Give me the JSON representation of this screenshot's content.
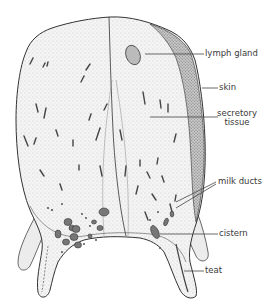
{
  "figure": {
    "labels": [
      {
        "id": "lymph-gland",
        "text": "lymph gland"
      },
      {
        "id": "skin",
        "text": "skin"
      },
      {
        "id": "secretory-tissue",
        "line1": "secretory",
        "line2": "tissue"
      },
      {
        "id": "milk-ducts",
        "text": "milk ducts"
      },
      {
        "id": "cistern",
        "text": "cistern"
      },
      {
        "id": "teat",
        "text": "teat"
      }
    ]
  },
  "colors": {
    "ink": "#3a3a3a",
    "fill": "#f2f2f2",
    "skin_shade": "#9a9a9a",
    "background": "#ffffff"
  }
}
